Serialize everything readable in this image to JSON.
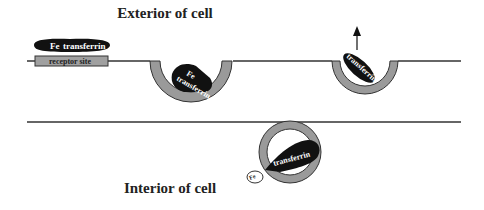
{
  "diagram": {
    "title_exterior": "Exterior of cell",
    "title_interior": "Interior of cell",
    "stages": [
      {
        "id": "binding",
        "complex_label_fe": "Fe",
        "complex_label_protein": "transferrin",
        "receptor_label": "receptor site"
      },
      {
        "id": "endocytosis-pit",
        "complex_label_fe": "Fe",
        "complex_label_protein": "transferrin"
      },
      {
        "id": "internal-vesicle",
        "complex_label_protein": "transferrin",
        "released_label": "Fe"
      },
      {
        "id": "recycling-exocytosis",
        "complex_label_protein": "transferrin",
        "arrow": "up-arrow"
      }
    ],
    "colors": {
      "membrane": "#333333",
      "vesicle": "#9a9a9a",
      "protein": "#111111",
      "receptor": "#a0a0a0",
      "text_light": "#ffffff",
      "text_dark": "#222222"
    }
  }
}
